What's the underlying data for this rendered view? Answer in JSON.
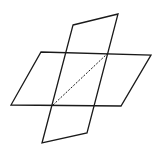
{
  "diagram": {
    "title": "",
    "stroke_color": "#1a1a1a",
    "background": "#ffffff",
    "horizontal_plane": {
      "points": "41,52 151,55 121,106 11,105"
    },
    "vertical_plane": {
      "points": "73,25 118,14 87,133 42,143"
    },
    "intersection_line": {
      "x1": 53,
      "y1": 105,
      "x2": 107,
      "y2": 54,
      "style": "dashed"
    }
  }
}
